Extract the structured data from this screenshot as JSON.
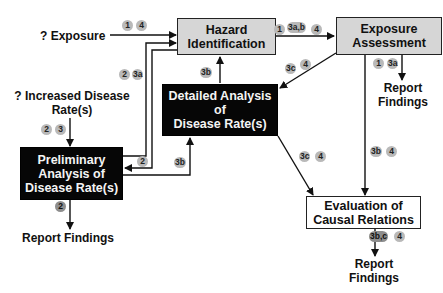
{
  "diagram": {
    "nodes": {
      "hazard": {
        "line1": "Hazard",
        "line2": "Identification"
      },
      "exposure_assessment": {
        "line1": "Exposure",
        "line2": "Assessment"
      },
      "detailed": {
        "line1": "Detailed Analysis",
        "line2": "of",
        "line3": "Disease Rate(s)"
      },
      "preliminary": {
        "line1": "Preliminary",
        "line2": "Analysis of",
        "line3": "Disease Rate(s)"
      },
      "evaluation": {
        "line1": "Evaluation of",
        "line2": "Causal Relations"
      }
    },
    "inputs": {
      "exposure": "? Exposure",
      "disease_line1": "? Increased Disease",
      "disease_line2": "Rate(s)"
    },
    "outputs": {
      "report_prelim": "Report Findings",
      "report_exposure_line1": "Report",
      "report_exposure_line2": "Findings",
      "report_eval_line1": "Report",
      "report_eval_line2": "Findings"
    },
    "badges": {
      "exposure_in_1": "1",
      "exposure_in_2": "4",
      "disease_up_1": "2",
      "disease_up_2": "3a",
      "disease_down_1": "2",
      "disease_down_2": "3",
      "hazard_to_exposure_1": "1",
      "hazard_to_exposure_2": "3a,b",
      "hazard_to_exposure_3": "4",
      "detailed_to_hazard": "3b",
      "exposure_to_detailed_1": "3c",
      "exposure_to_detailed_2": "4",
      "exposure_report_1": "1",
      "exposure_report_2": "3a",
      "back_to_prelim": "2",
      "prelim_to_detailed": "3b",
      "prelim_report": "2",
      "detailed_to_eval_1": "3c",
      "detailed_to_eval_2": "4",
      "exposure_to_eval_1": "3b",
      "exposure_to_eval_2": "4",
      "eval_report_1": "3b,c",
      "eval_report_2": "4"
    },
    "colors": {
      "gray_box": "#d6d6d6",
      "black_box": "#060606",
      "badge": "#b9b9b9",
      "line": "#111111"
    }
  }
}
